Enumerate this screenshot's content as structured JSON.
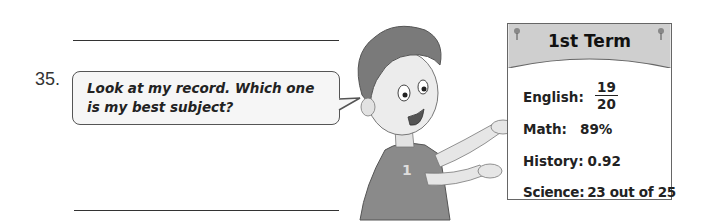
{
  "question": {
    "number": "35.",
    "speech": "Look at my record.  Which one is my best subject?"
  },
  "record_card": {
    "title": "1st Term",
    "rows": [
      {
        "label": "English:",
        "value_numerator": "19",
        "value_denominator": "20"
      },
      {
        "label": "Math:",
        "value": "89%"
      },
      {
        "label": "History:",
        "value": "0.92"
      },
      {
        "label": "Science:",
        "value": "23 out of 25"
      }
    ]
  },
  "illustration": "boy-presenting-card"
}
